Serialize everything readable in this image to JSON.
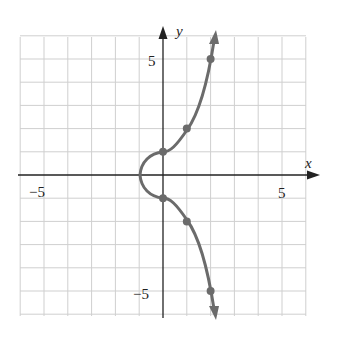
{
  "chart_data": {
    "type": "line",
    "title": "",
    "xlabel": "x",
    "ylabel": "y",
    "xlim": [
      -6,
      6
    ],
    "ylim": [
      -6,
      6
    ],
    "grid": true,
    "x_tick_labels": [
      {
        "value": -5,
        "label": "−5"
      },
      {
        "value": 5,
        "label": "5"
      }
    ],
    "y_tick_labels": [
      {
        "value": 5,
        "label": "5"
      },
      {
        "value": -5,
        "label": "−5"
      }
    ],
    "series": [
      {
        "name": "curve",
        "color": "#6b6b6b",
        "marked_points": [
          {
            "x": 2,
            "y": 5
          },
          {
            "x": 1,
            "y": 2
          },
          {
            "x": 0,
            "y": 1
          },
          {
            "x": 0,
            "y": -1
          },
          {
            "x": 1,
            "y": -2
          },
          {
            "x": 2,
            "y": -5
          }
        ],
        "vertex": {
          "x": -1,
          "y": 0
        },
        "arrows": [
          "upper-end",
          "lower-end"
        ]
      }
    ]
  },
  "labels": {
    "x_axis": "x",
    "y_axis": "y",
    "x_neg5": "−5",
    "x_pos5": "5",
    "y_pos5": "5",
    "y_neg5": "−5"
  }
}
